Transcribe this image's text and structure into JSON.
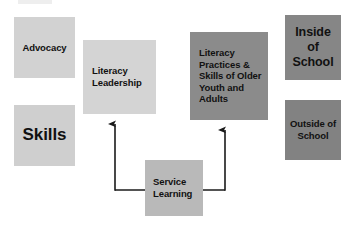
{
  "diagram": {
    "background_color": "#ffffff",
    "palette": {
      "light_gray": "#d2d2d2",
      "mid_gray": "#b9b9b9",
      "dark_gray": "#868686",
      "line_color": "#1a1a1a",
      "text_color": "#111111"
    },
    "nodes": [
      {
        "id": "advocacy",
        "label": "Advocacy",
        "color": "#d2d2d2",
        "x": 14,
        "y": 17,
        "width": 61,
        "height": 61
      },
      {
        "id": "skills",
        "label": "Skills",
        "color": "#cfcfcf",
        "x": 14,
        "y": 105,
        "width": 61,
        "height": 61
      },
      {
        "id": "literacy_leadership",
        "label": "Literacy\nLeadership",
        "color": "#d4d4d4",
        "x": 83,
        "y": 40,
        "width": 73,
        "height": 74
      },
      {
        "id": "literacy_practices",
        "label": "Literacy\nPractices &\nSkills of Older\nYouth and\nAdults",
        "color": "#8b8b8b",
        "x": 190,
        "y": 32,
        "width": 78,
        "height": 88
      },
      {
        "id": "inside_school",
        "label": "Inside\nof\nSchool",
        "color": "#868686",
        "x": 285,
        "y": 15,
        "width": 56,
        "height": 65
      },
      {
        "id": "outside_school",
        "label": "Outside of\nSchool",
        "color": "#828282",
        "x": 285,
        "y": 100,
        "width": 56,
        "height": 60
      },
      {
        "id": "service_learning",
        "label": "Service\nLearning",
        "color": "#b9b9b9",
        "x": 145,
        "y": 160,
        "width": 58,
        "height": 56
      }
    ],
    "connectors": [
      {
        "id": "service-learning-to-literacy-leadership",
        "from": "service_learning",
        "to": "literacy_leadership",
        "arrow": "end",
        "path": "M 115 190 L 115 122"
      },
      {
        "id": "service-learning-to-literacy-practices",
        "from": "service_learning",
        "to": "literacy_practices",
        "arrow": "end",
        "path": "M 225 190 L 225 128"
      },
      {
        "id": "service-learning-horizontal-rail",
        "from": "service_learning",
        "to": "service_learning",
        "arrow": "none",
        "path": "M 115 190 L 225 190"
      }
    ]
  }
}
